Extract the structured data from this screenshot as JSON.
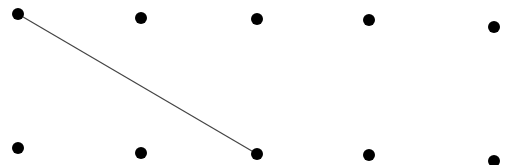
{
  "diagram": {
    "width": 519,
    "height": 165,
    "background": "#ffffff",
    "dot_color": "#000000",
    "dot_radius": 6,
    "line_color": "#444444",
    "line_width": 1.2,
    "dots": [
      {
        "id": "t1",
        "row": "top",
        "x": 18,
        "y": 14
      },
      {
        "id": "t2",
        "row": "top",
        "x": 141,
        "y": 18
      },
      {
        "id": "t3",
        "row": "top",
        "x": 257,
        "y": 19
      },
      {
        "id": "t4",
        "row": "top",
        "x": 369,
        "y": 20
      },
      {
        "id": "t5",
        "row": "top",
        "x": 494,
        "y": 27
      },
      {
        "id": "b1",
        "row": "bottom",
        "x": 18,
        "y": 148
      },
      {
        "id": "b2",
        "row": "bottom",
        "x": 141,
        "y": 153
      },
      {
        "id": "b3",
        "row": "bottom",
        "x": 257,
        "y": 154
      },
      {
        "id": "b4",
        "row": "bottom",
        "x": 369,
        "y": 155
      },
      {
        "id": "b5",
        "row": "bottom",
        "x": 494,
        "y": 161
      }
    ],
    "lines": [
      {
        "from": "t1",
        "to": "b3"
      }
    ]
  }
}
